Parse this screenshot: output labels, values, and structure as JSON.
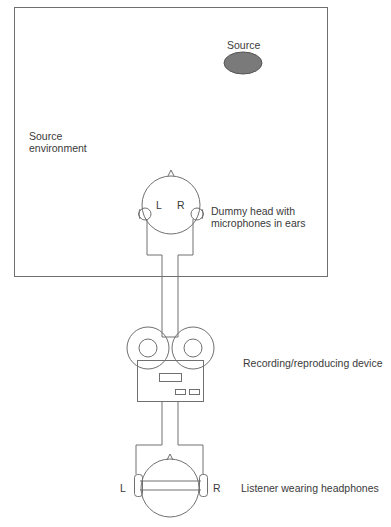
{
  "diagram": {
    "type": "binaural recording and reproduction schematic",
    "colors": {
      "line": "#707070",
      "source_fill": "#7a7a7a",
      "text": "#3a3a3a"
    },
    "labels": {
      "source": "Source",
      "source_environment_line1": "Source",
      "source_environment_line2": "environment",
      "dummy_head_line1": "Dummy head with",
      "dummy_head_line2": "microphones in ears",
      "dummy_left": "L",
      "dummy_right": "R",
      "device": "Recording/reproducing device",
      "listener": "Listener wearing headphones",
      "listener_left": "L",
      "listener_right": "R"
    }
  }
}
